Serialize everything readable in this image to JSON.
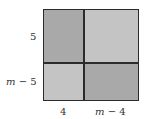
{
  "diagram": {
    "type": "area-model",
    "colors": {
      "dark": "#a9a9a9",
      "light": "#c4c4c4",
      "line": "#2b2b2b"
    },
    "row_labels": [
      "5",
      "m − 5"
    ],
    "column_labels": [
      "4",
      "m − 4"
    ],
    "cells": [
      {
        "row": 0,
        "col": 0,
        "shade": "dark"
      },
      {
        "row": 0,
        "col": 1,
        "shade": "light"
      },
      {
        "row": 1,
        "col": 0,
        "shade": "light"
      },
      {
        "row": 1,
        "col": 1,
        "shade": "dark"
      }
    ]
  }
}
